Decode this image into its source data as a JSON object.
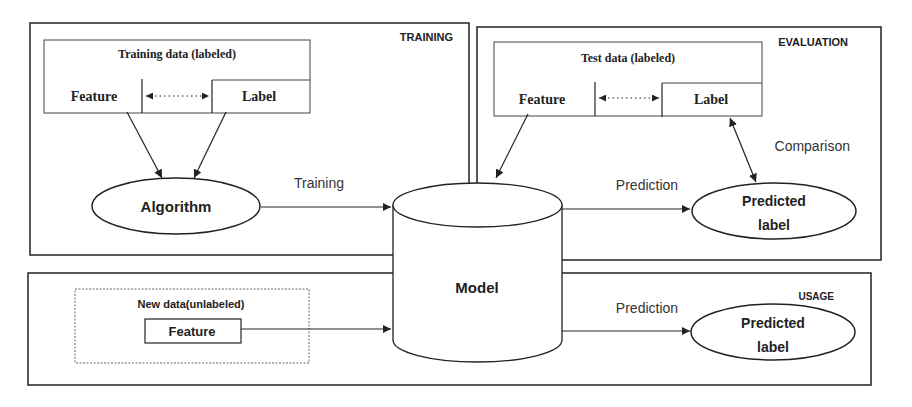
{
  "sections": {
    "training": {
      "title": "TRAINING",
      "data_box_title": "Training data (labeled)",
      "feature": "Feature",
      "label": "Label",
      "algorithm": "Algorithm"
    },
    "evaluation": {
      "title": "EVALUATION",
      "data_box_title": "Test data (labeled)",
      "feature": "Feature",
      "label": "Label",
      "predicted_label_line1": "Predicted",
      "predicted_label_line2": "label",
      "comparison": "Comparison"
    },
    "usage": {
      "title": "USAGE",
      "data_box_title": "New data(unlabeled)",
      "feature": "Feature",
      "predicted_label_line1": "Predicted",
      "predicted_label_line2": "label"
    }
  },
  "model": {
    "label": "Model"
  },
  "edges": {
    "training": "Training",
    "prediction_eval": "Prediction",
    "prediction_usage": "Prediction"
  },
  "colors": {
    "stroke": "#222222",
    "background": "#ffffff"
  }
}
